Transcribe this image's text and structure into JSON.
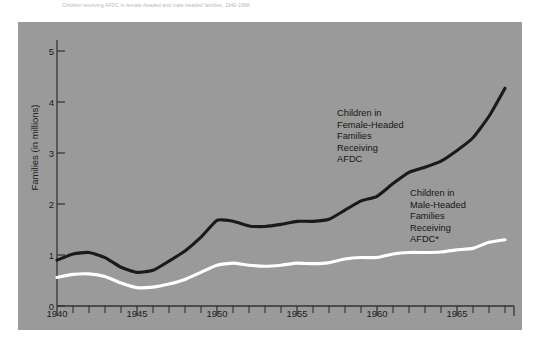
{
  "caption": {
    "text": "Children receiving AFDC in female-headed and male-headed families, 1940-1968"
  },
  "colors": {
    "panel_background": "#9a9a9a",
    "page_background": "#ffffff",
    "series_female": "#1a1a1a",
    "series_male": "#ffffff",
    "axis": "#333333",
    "text": "#1d1d1d"
  },
  "chart_data": {
    "type": "line",
    "title": "",
    "xlabel": "",
    "ylabel": "Families (in millions)",
    "xlim": [
      1940,
      1968.5
    ],
    "ylim": [
      0,
      5.4
    ],
    "grid": false,
    "legend": "annotations-inline",
    "ytick_labels": [
      "0",
      "1",
      "2",
      "3",
      "4",
      "5"
    ],
    "ytick_values": [
      0,
      1,
      2,
      3,
      4,
      5
    ],
    "xtick_labels": [
      "1940",
      "1945",
      "1950",
      "1955",
      "1960",
      "1965"
    ],
    "xtick_values": [
      1940,
      1945,
      1950,
      1955,
      1960,
      1965
    ],
    "minor_xticks_interval": 1,
    "x": [
      1940,
      1941,
      1942,
      1943,
      1944,
      1945,
      1946,
      1947,
      1948,
      1949,
      1950,
      1951,
      1952,
      1953,
      1954,
      1955,
      1956,
      1957,
      1958,
      1959,
      1960,
      1961,
      1962,
      1963,
      1964,
      1965,
      1966,
      1967,
      1968
    ],
    "series": [
      {
        "name": "Children in Female-Headed Families Receiving AFDC",
        "color": "#1a1a1a",
        "values": [
          0.9,
          1.02,
          1.05,
          0.95,
          0.76,
          0.66,
          0.7,
          0.88,
          1.08,
          1.35,
          1.68,
          1.66,
          1.57,
          1.56,
          1.6,
          1.66,
          1.66,
          1.7,
          1.88,
          2.06,
          2.15,
          2.4,
          2.62,
          2.72,
          2.84,
          3.05,
          3.3,
          3.72,
          4.27
        ]
      },
      {
        "name": "Children in Male-Headed Families Receiving AFDC*",
        "color": "#ffffff",
        "values": [
          0.56,
          0.62,
          0.63,
          0.58,
          0.45,
          0.36,
          0.37,
          0.43,
          0.52,
          0.66,
          0.8,
          0.84,
          0.8,
          0.78,
          0.8,
          0.84,
          0.83,
          0.85,
          0.92,
          0.95,
          0.95,
          1.02,
          1.05,
          1.05,
          1.06,
          1.1,
          1.13,
          1.25,
          1.3
        ]
      }
    ],
    "annotations": [
      {
        "id": "annotation-female-headed",
        "lines": [
          "Children in",
          "Female-Headed",
          "Families",
          "Receiving",
          "AFDC"
        ],
        "x_px": 337,
        "y_px": 108
      },
      {
        "id": "annotation-male-headed",
        "lines": [
          "Children in",
          "Male-Headed",
          "Families",
          "Receiving",
          "AFDC*"
        ],
        "x_px": 410,
        "y_px": 188
      }
    ]
  }
}
